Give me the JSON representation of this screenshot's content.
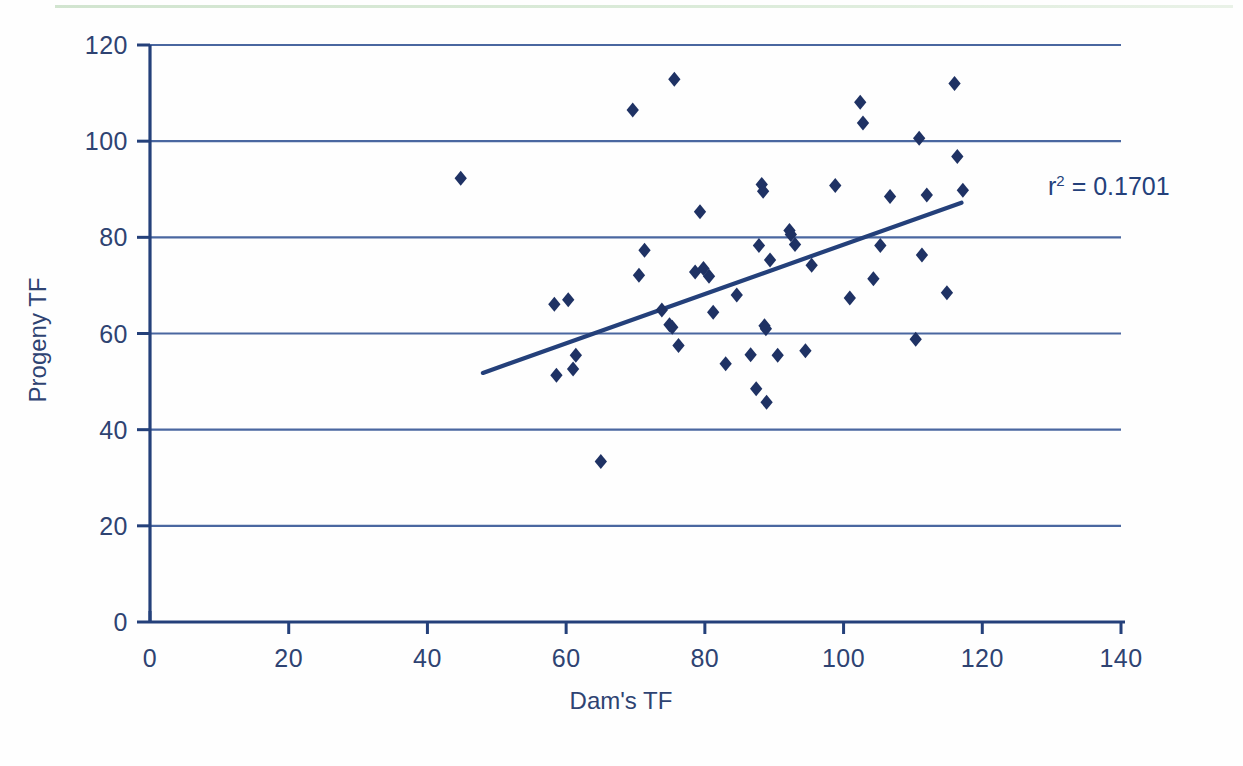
{
  "figure": {
    "background_color": "#fefefe",
    "top_rule_color": "#d4e7d1",
    "accent_color": "#24407a",
    "gridline_color": "#4a67a0",
    "marker_color": "#1f3264"
  },
  "annotations": {
    "r_squared_prefix": "r",
    "r_squared_exponent": "2",
    "r_squared_value": "= 0.1701",
    "r_squared_full": "r² = 0.1701"
  },
  "chart_data": {
    "type": "scatter",
    "title": "",
    "xlabel": "Dam's TF",
    "ylabel": "Progeny TF",
    "xlim": [
      0,
      140
    ],
    "ylim": [
      0,
      120
    ],
    "xticks": [
      0,
      20,
      40,
      60,
      80,
      100,
      120,
      140
    ],
    "yticks": [
      0,
      20,
      40,
      60,
      80,
      100,
      120
    ],
    "xticklabels": [
      "0",
      "20",
      "40",
      "60",
      "80",
      "100",
      "120",
      "140"
    ],
    "yticklabels": [
      "0",
      "20",
      "40",
      "60",
      "80",
      "100",
      "120"
    ],
    "grid": "horizontal",
    "legend": "none",
    "marker": "diamond",
    "series": [
      {
        "name": "Dam vs Progeny TF",
        "points": [
          [
            44.8,
            92.3
          ],
          [
            58.3,
            66.1
          ],
          [
            58.6,
            51.3
          ],
          [
            60.3,
            67.0
          ],
          [
            61.0,
            52.6
          ],
          [
            61.4,
            55.5
          ],
          [
            65.0,
            33.4
          ],
          [
            69.6,
            106.5
          ],
          [
            70.5,
            72.1
          ],
          [
            71.3,
            77.3
          ],
          [
            73.8,
            64.9
          ],
          [
            74.9,
            61.8
          ],
          [
            75.3,
            61.3
          ],
          [
            75.6,
            112.9
          ],
          [
            76.2,
            57.5
          ],
          [
            78.6,
            72.8
          ],
          [
            79.3,
            85.3
          ],
          [
            79.8,
            73.5
          ],
          [
            80.6,
            71.9
          ],
          [
            81.2,
            64.4
          ],
          [
            83.0,
            53.7
          ],
          [
            84.6,
            68.0
          ],
          [
            86.6,
            55.6
          ],
          [
            87.4,
            48.5
          ],
          [
            87.8,
            78.3
          ],
          [
            88.2,
            91.0
          ],
          [
            88.4,
            89.6
          ],
          [
            88.6,
            61.6
          ],
          [
            88.8,
            61.0
          ],
          [
            88.9,
            45.7
          ],
          [
            89.4,
            75.3
          ],
          [
            90.5,
            55.5
          ],
          [
            92.2,
            81.4
          ],
          [
            92.4,
            80.6
          ],
          [
            93.0,
            78.5
          ],
          [
            94.5,
            56.4
          ],
          [
            95.4,
            74.2
          ],
          [
            98.8,
            90.8
          ],
          [
            100.9,
            67.4
          ],
          [
            102.4,
            108.1
          ],
          [
            102.8,
            103.8
          ],
          [
            104.3,
            71.4
          ],
          [
            105.3,
            78.3
          ],
          [
            106.7,
            88.5
          ],
          [
            110.4,
            58.8
          ],
          [
            110.9,
            100.6
          ],
          [
            111.3,
            76.3
          ],
          [
            112.0,
            88.8
          ],
          [
            114.9,
            68.5
          ],
          [
            116.0,
            112.0
          ],
          [
            116.4,
            96.8
          ],
          [
            117.2,
            89.8
          ]
        ]
      }
    ],
    "trendline": {
      "label": "linear fit",
      "x_start": 48.0,
      "y_start": 51.8,
      "x_end": 117.0,
      "y_end": 87.2,
      "r_squared": 0.1701
    }
  }
}
